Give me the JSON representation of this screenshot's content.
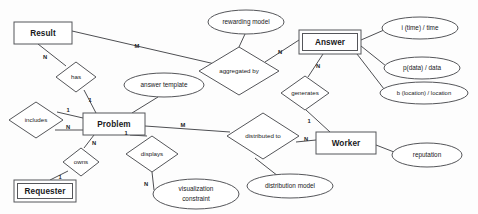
{
  "diagram": {
    "type": "entity-relationship-diagram",
    "background_color": "#fdfdfd",
    "stroke_color": "#55565a",
    "text_color": "#18191b"
  },
  "entities": [
    {
      "id": "result",
      "label": "Result",
      "weak": false,
      "x": 14,
      "y": 22,
      "w": 58,
      "h": 22
    },
    {
      "id": "answer",
      "label": "Answer",
      "weak": true,
      "x": 299,
      "y": 30,
      "w": 62,
      "h": 24
    },
    {
      "id": "problem",
      "label": "Problem",
      "weak": false,
      "x": 83,
      "y": 113,
      "w": 62,
      "h": 22
    },
    {
      "id": "worker",
      "label": "Worker",
      "weak": false,
      "x": 316,
      "y": 132,
      "w": 60,
      "h": 22
    },
    {
      "id": "requester",
      "label": "Requester",
      "weak": true,
      "x": 14,
      "y": 180,
      "w": 62,
      "h": 22
    }
  ],
  "relationships": [
    {
      "id": "has",
      "label": "has",
      "cx": 76,
      "cy": 77,
      "rx": 20,
      "ry": 15
    },
    {
      "id": "aggregated-by",
      "label": "aggregated by",
      "cx": 239,
      "cy": 71,
      "rx": 40,
      "ry": 24
    },
    {
      "id": "includes",
      "label": "includes",
      "cx": 36,
      "cy": 120,
      "rx": 27,
      "ry": 18
    },
    {
      "id": "owns",
      "label": "owns",
      "cx": 81,
      "cy": 162,
      "rx": 18,
      "ry": 14
    },
    {
      "id": "displays",
      "label": "displays",
      "cx": 152,
      "cy": 154,
      "rx": 26,
      "ry": 18
    },
    {
      "id": "distributed-to",
      "label": "distributed to",
      "cx": 263,
      "cy": 136,
      "rx": 36,
      "ry": 23
    },
    {
      "id": "generates",
      "label": "generates",
      "cx": 305,
      "cy": 93,
      "rx": 24,
      "ry": 17
    }
  ],
  "attributes": [
    {
      "id": "rewarding-model",
      "label": "rewarding model",
      "lines": [
        "rewarding model"
      ],
      "cx": 246,
      "cy": 22,
      "rx": 38,
      "ry": 12
    },
    {
      "id": "answer-template",
      "label": "answer template",
      "lines": [
        "answer template"
      ],
      "cx": 164,
      "cy": 85,
      "rx": 40,
      "ry": 12
    },
    {
      "id": "time-attribute",
      "label": "i (time) / time",
      "lines": [
        "i (time) / time"
      ],
      "cx": 420,
      "cy": 28,
      "rx": 38,
      "ry": 11
    },
    {
      "id": "data-attribute",
      "label": "p(data) / data",
      "lines": [
        "p(data) / data"
      ],
      "cx": 422,
      "cy": 68,
      "rx": 38,
      "ry": 11
    },
    {
      "id": "location-attribute",
      "label": "b (location) / location",
      "lines": [
        "b (location) / location"
      ],
      "cx": 424,
      "cy": 93,
      "rx": 44,
      "ry": 11
    },
    {
      "id": "reputation",
      "label": "reputation",
      "lines": [
        "reputation"
      ],
      "cx": 427,
      "cy": 155,
      "rx": 35,
      "ry": 12
    },
    {
      "id": "distribution-model",
      "label": "distribution model",
      "lines": [
        "distribution model"
      ],
      "cx": 290,
      "cy": 186,
      "rx": 43,
      "ry": 12
    },
    {
      "id": "visualization-constraint",
      "label": "visualization constraint",
      "lines": [
        "visualization",
        "constraint"
      ],
      "cx": 196,
      "cy": 194,
      "rx": 43,
      "ry": 15
    }
  ],
  "connections": [
    {
      "id": "result-has",
      "from": "result",
      "to": "has",
      "cardinality": "N",
      "label_x": 45,
      "label_y": 57
    },
    {
      "id": "has-problem",
      "from": "has",
      "to": "problem",
      "cardinality": "1",
      "label_x": 90,
      "label_y": 100
    },
    {
      "id": "result-aggregated",
      "from": "result",
      "to": "aggregated-by",
      "cardinality": "M",
      "label_x": 137,
      "label_y": 48
    },
    {
      "id": "aggregated-answer",
      "from": "aggregated-by",
      "to": "answer",
      "cardinality": "N",
      "label_x": 279,
      "label_y": 53
    },
    {
      "id": "aggregated-rewarding",
      "from": "aggregated-by",
      "to": "rewarding-model",
      "cardinality": "",
      "label_x": 0,
      "label_y": 0
    },
    {
      "id": "answer-generates",
      "from": "answer",
      "to": "generates",
      "cardinality": "N",
      "label_x": 317,
      "label_y": 68
    },
    {
      "id": "generates-worker",
      "from": "generates",
      "to": "worker",
      "cardinality": "1",
      "label_x": 310,
      "label_y": 120
    },
    {
      "id": "answer-time",
      "from": "answer",
      "to": "time-attribute",
      "cardinality": "",
      "label_x": 0,
      "label_y": 0
    },
    {
      "id": "answer-data",
      "from": "answer",
      "to": "data-attribute",
      "cardinality": "",
      "label_x": 0,
      "label_y": 0
    },
    {
      "id": "answer-location",
      "from": "answer",
      "to": "location-attribute",
      "cardinality": "",
      "label_x": 0,
      "label_y": 0
    },
    {
      "id": "problem-includes-1",
      "from": "problem",
      "to": "includes",
      "cardinality": "1",
      "label_x": 68,
      "label_y": 115
    },
    {
      "id": "problem-includes-n",
      "from": "includes",
      "to": "problem",
      "cardinality": "N",
      "label_x": 68,
      "label_y": 132
    },
    {
      "id": "problem-answer-template",
      "from": "problem",
      "to": "answer-template",
      "cardinality": "",
      "label_x": 0,
      "label_y": 0
    },
    {
      "id": "problem-owns",
      "from": "problem",
      "to": "owns",
      "cardinality": "N",
      "label_x": 93,
      "label_y": 145
    },
    {
      "id": "owns-requester",
      "from": "owns",
      "to": "requester",
      "cardinality": "1",
      "label_x": 61,
      "label_y": 178
    },
    {
      "id": "problem-displays",
      "from": "problem",
      "to": "displays",
      "cardinality": "1",
      "label_x": 124,
      "label_y": 135
    },
    {
      "id": "displays-visualization",
      "from": "displays",
      "to": "visualization-constraint",
      "cardinality": "N",
      "label_x": 147,
      "label_y": 183
    },
    {
      "id": "problem-distributed",
      "from": "problem",
      "to": "distributed-to",
      "cardinality": "M",
      "label_x": 182,
      "label_y": 126
    },
    {
      "id": "distributed-worker",
      "from": "distributed-to",
      "to": "worker",
      "cardinality": "N",
      "label_x": 303,
      "label_y": 141
    },
    {
      "id": "distributed-model",
      "from": "distributed-to",
      "to": "distribution-model",
      "cardinality": "",
      "label_x": 0,
      "label_y": 0
    },
    {
      "id": "worker-reputation",
      "from": "worker",
      "to": "reputation",
      "cardinality": "",
      "label_x": 0,
      "label_y": 0
    }
  ]
}
